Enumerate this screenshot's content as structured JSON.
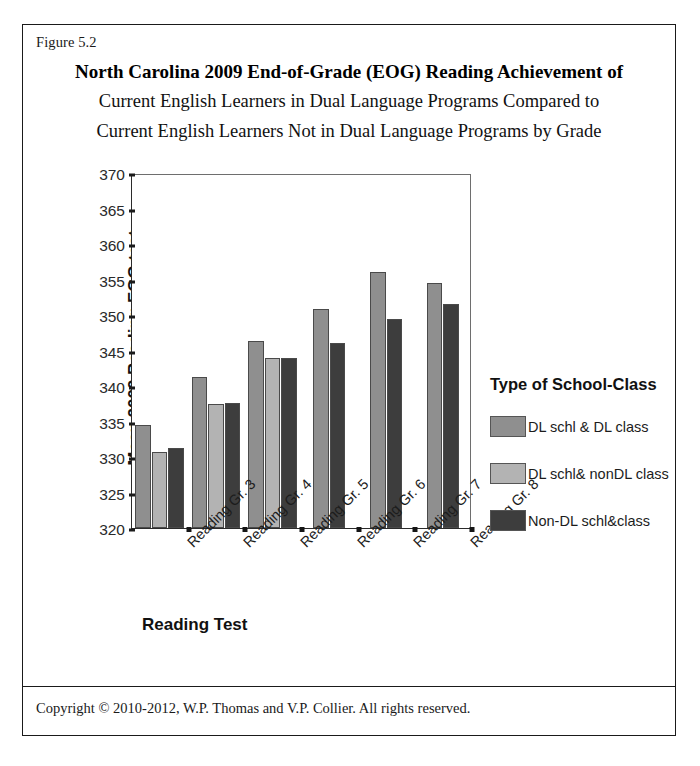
{
  "figure_label": "Figure 5.2",
  "title": {
    "line1": "North Carolina 2009 End-of-Grade (EOG) Reading Achievement of",
    "line2": "Current English Learners in Dual Language Programs Compared to",
    "line3": "Current English Learners Not in Dual Language Programs by Grade"
  },
  "footer": {
    "copyright": "Copyright © 2010-2012, W.P. Thomas and V.P. Collier.  All rights reserved."
  },
  "legend": {
    "title": "Type of School-Class",
    "entries": [
      {
        "label": "DL schl & DL class",
        "color": "#8f8f8f"
      },
      {
        "label": "DL schl& nonDL class",
        "color": "#b3b3b3"
      },
      {
        "label": "Non-DL schl&class",
        "color": "#3d3d3d"
      }
    ]
  },
  "chart_data": {
    "type": "bar",
    "title": "North Carolina 2009 End-of-Grade (EOG) Reading Achievement of Current English Learners in Dual Language Programs Compared to Current English Learners Not in Dual Language Programs by Grade",
    "xlabel": "Reading Test",
    "ylabel": "Mean 2009 Reading EOG test",
    "categories": [
      "Reading Gr. 3",
      "Reading Gr. 4",
      "Reading Gr. 5",
      "Reading Gr. 6",
      "Reading Gr. 7",
      "Reading Gr. 8"
    ],
    "series": [
      {
        "name": "DL schl & DL class",
        "color": "#8f8f8f",
        "values": [
          334.5,
          341.2,
          346.3,
          350.8,
          356.1,
          354.5
        ]
      },
      {
        "name": "DL schl& nonDL class",
        "color": "#b3b3b3",
        "values": [
          330.7,
          337.4,
          344.0,
          null,
          null,
          null
        ]
      },
      {
        "name": "Non-DL schl&class",
        "color": "#3d3d3d",
        "values": [
          331.3,
          337.6,
          343.9,
          346.1,
          349.4,
          351.6
        ]
      }
    ],
    "ylim": [
      320,
      370
    ],
    "yticks": [
      320,
      325,
      330,
      335,
      340,
      345,
      350,
      355,
      360,
      365,
      370
    ],
    "grid": false,
    "legend_position": "right",
    "xtick_rotation": -45
  }
}
